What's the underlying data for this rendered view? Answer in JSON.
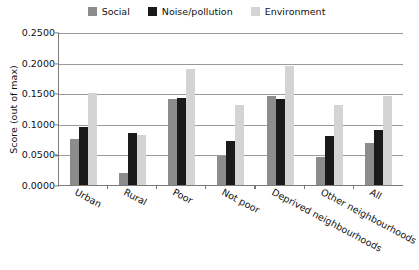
{
  "chart_data": {
    "type": "bar",
    "title": "",
    "xlabel": "",
    "ylabel": "Score (out of max)",
    "ylim": [
      0.0,
      0.25
    ],
    "ytick_labels": [
      "0.2500",
      "0.2000",
      "0.1500",
      "0.1000",
      "0.0500",
      "0.0000"
    ],
    "ytick_values": [
      0.25,
      0.2,
      0.15,
      0.1,
      0.05,
      0.0
    ],
    "grid": true,
    "legend_position": "top-center",
    "categories": [
      "Urban",
      "Rural",
      "Poor",
      "Not poor",
      "Deprived neighbourhoods",
      "Other neighbourhoods",
      "All"
    ],
    "series": [
      {
        "name": "Social",
        "color": "#8c8c8c",
        "values": [
          0.075,
          0.02,
          0.14,
          0.048,
          0.146,
          0.045,
          0.068
        ]
      },
      {
        "name": "Noise/pollution",
        "color": "#1a1a1a",
        "values": [
          0.095,
          0.085,
          0.142,
          0.072,
          0.14,
          0.08,
          0.09
        ]
      },
      {
        "name": "Environment",
        "color": "#d4d4d4",
        "values": [
          0.15,
          0.082,
          0.19,
          0.13,
          0.195,
          0.13,
          0.145
        ]
      }
    ]
  },
  "legend": {
    "items": [
      {
        "label": "Social",
        "color": "#8c8c8c"
      },
      {
        "label": "Noise/pollution",
        "color": "#1a1a1a"
      },
      {
        "label": "Environment",
        "color": "#d4d4d4"
      }
    ]
  },
  "axis": {
    "y_title": "Score (out of max)"
  },
  "colors": {
    "axis_line": "#7a7a7a",
    "gridline": "#9a9a9a",
    "background": "#ffffff",
    "text": "#111111"
  }
}
